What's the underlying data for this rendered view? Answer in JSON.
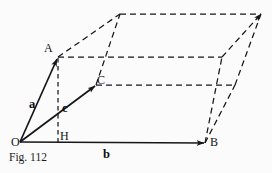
{
  "figure": {
    "caption": "Fig. 112",
    "background_color": "#fbfbfc",
    "ink_color": "#161619",
    "points": [
      {
        "name": "O",
        "label": "O",
        "x": 20,
        "y": 142
      },
      {
        "name": "A",
        "label": "A",
        "x": 58,
        "y": 57
      },
      {
        "name": "B",
        "label": "B",
        "x": 205,
        "y": 143
      },
      {
        "name": "C",
        "label": "C",
        "x": 96,
        "y": 85
      },
      {
        "name": "H",
        "label": "H",
        "x": 58,
        "y": 143
      }
    ],
    "vectors": [
      {
        "name": "a",
        "label": "a",
        "from": "O",
        "to": "A",
        "style": "solid-arrow"
      },
      {
        "name": "b",
        "label": "b",
        "from": "O",
        "to": "B",
        "style": "solid-arrow"
      },
      {
        "name": "c",
        "label": "c",
        "from": "O",
        "to": "C",
        "style": "solid-arrow"
      }
    ],
    "vector_labels": [
      {
        "name": "label-a",
        "text": "a",
        "x": 29,
        "y": 98
      },
      {
        "name": "label-b",
        "text": "b",
        "x": 103,
        "y": 148
      },
      {
        "name": "label-c",
        "text": "c",
        "x": 62,
        "y": 102
      }
    ],
    "point_labels": [
      {
        "name": "label-O",
        "text": "O",
        "x": 11,
        "y": 136
      },
      {
        "name": "label-A",
        "text": "A",
        "x": 44,
        "y": 42
      },
      {
        "name": "label-B",
        "text": "B",
        "x": 210,
        "y": 136
      },
      {
        "name": "label-C",
        "text": "C",
        "x": 97,
        "y": 74
      },
      {
        "name": "label-H",
        "text": "H",
        "x": 60,
        "y": 130
      }
    ],
    "dashed_construction": {
      "description": "parallelepiped edges and altitude drawn as dashed lines",
      "altitude": {
        "from": "A",
        "to": "H"
      }
    }
  }
}
